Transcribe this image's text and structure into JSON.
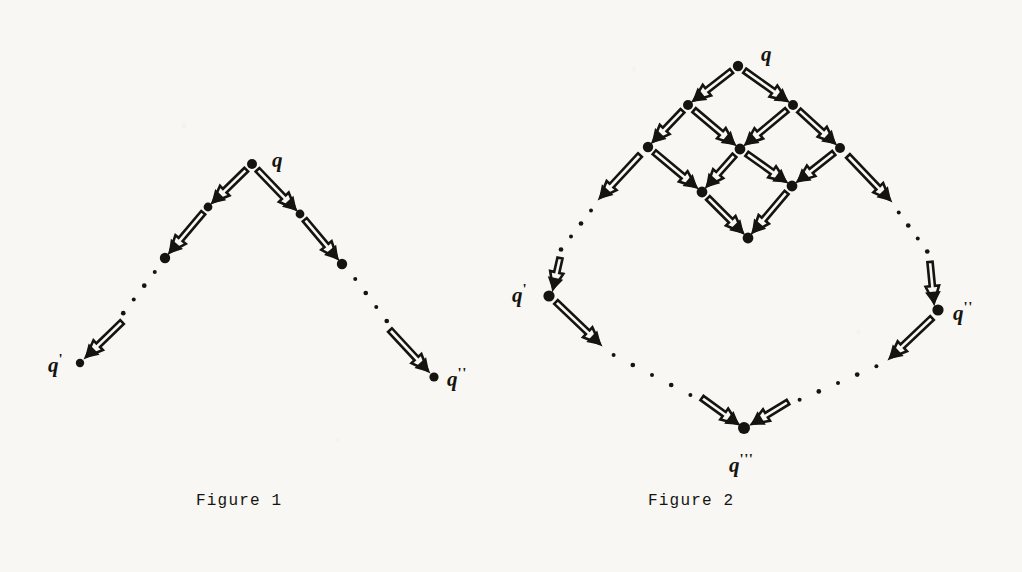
{
  "document": {
    "background_color": "#f8f7f3",
    "ink_color": "#16140f",
    "kind": "scanned-mathematical-figure-page"
  },
  "figures": [
    {
      "id": "figure-1",
      "caption": "Figure 1",
      "caption_pos": [
        196,
        492
      ],
      "description": "Inverted-V chain diagram: source node q at apex with two descending double-arrow chains, each broken by a dotted continuation, ending at q' (left) and q'' (right).",
      "nodes": [
        {
          "id": "f1-q",
          "label": "q",
          "prime": "",
          "x": 252,
          "y": 164,
          "r": 5.0,
          "label_x": 272,
          "label_y": 150
        },
        {
          "id": "f1-l1",
          "label": "",
          "prime": "",
          "x": 208,
          "y": 207,
          "r": 4.4
        },
        {
          "id": "f1-l2",
          "label": "",
          "prime": "",
          "x": 165,
          "y": 258,
          "r": 5.2
        },
        {
          "id": "f1-qp",
          "label": "q",
          "prime": "'",
          "x": 80,
          "y": 363,
          "r": 4.2,
          "label_x": 48,
          "label_y": 352
        },
        {
          "id": "f1-r1",
          "label": "",
          "prime": "",
          "x": 300,
          "y": 214,
          "r": 4.4
        },
        {
          "id": "f1-r2",
          "label": "",
          "prime": "",
          "x": 342,
          "y": 264,
          "r": 5.2
        },
        {
          "id": "f1-qpp",
          "label": "q",
          "prime": "''",
          "x": 434,
          "y": 377,
          "r": 4.6,
          "label_x": 447,
          "label_y": 366
        }
      ],
      "arrows": [
        {
          "from": "f1-q",
          "to": "f1-l1"
        },
        {
          "from": "f1-l1",
          "to": "f1-l2"
        },
        {
          "from": "f1-q",
          "to": "f1-r1"
        },
        {
          "from": "f1-r1",
          "to": "f1-r2"
        }
      ],
      "dotted_paths": [
        {
          "from": [
            160,
            265
          ],
          "to": [
            118,
            320
          ],
          "dots": 4
        },
        {
          "from": [
            350,
            272
          ],
          "to": [
            392,
            328
          ],
          "dots": 4
        }
      ],
      "terminal_arrows": [
        {
          "from": [
            122,
            322
          ],
          "to": [
            86,
            357
          ]
        },
        {
          "from": [
            390,
            330
          ],
          "to": [
            428,
            371
          ]
        }
      ]
    },
    {
      "id": "figure-2",
      "caption": "Figure 2",
      "caption_pos": [
        648,
        492
      ],
      "description": "Diamond lattice diagram: top node q fans out through a 3x3 grid of intermediate nodes, then dotted continuations reach q' (left) and q'' (right), which converge via dotted paths onto q''' at the bottom.",
      "nodes": [
        {
          "id": "f2-q",
          "label": "q",
          "prime": "",
          "x": 738,
          "y": 66,
          "r": 5.2,
          "label_x": 761,
          "label_y": 44
        },
        {
          "id": "f2-a1",
          "label": "",
          "prime": "",
          "x": 688,
          "y": 105,
          "r": 5.0
        },
        {
          "id": "f2-a2",
          "label": "",
          "prime": "",
          "x": 793,
          "y": 105,
          "r": 5.0
        },
        {
          "id": "f2-b1",
          "label": "",
          "prime": "",
          "x": 648,
          "y": 147,
          "r": 5.2
        },
        {
          "id": "f2-b2",
          "label": "",
          "prime": "",
          "x": 740,
          "y": 149,
          "r": 5.4
        },
        {
          "id": "f2-b3",
          "label": "",
          "prime": "",
          "x": 840,
          "y": 148,
          "r": 5.0
        },
        {
          "id": "f2-c1",
          "label": "",
          "prime": "",
          "x": 702,
          "y": 192,
          "r": 5.4
        },
        {
          "id": "f2-c2",
          "label": "",
          "prime": "",
          "x": 792,
          "y": 186,
          "r": 5.4
        },
        {
          "id": "f2-d1",
          "label": "",
          "prime": "",
          "x": 748,
          "y": 238,
          "r": 5.4
        },
        {
          "id": "f2-qp",
          "label": "q",
          "prime": "'",
          "x": 549,
          "y": 296,
          "r": 5.6,
          "label_x": 512,
          "label_y": 282
        },
        {
          "id": "f2-qpp",
          "label": "q",
          "prime": "''",
          "x": 938,
          "y": 310,
          "r": 5.6,
          "label_x": 953,
          "label_y": 300
        },
        {
          "id": "f2-qppp",
          "label": "q",
          "prime": "'''",
          "x": 744,
          "y": 428,
          "r": 6.0,
          "label_x": 729,
          "label_y": 452
        }
      ],
      "arrows": [
        {
          "from": "f2-q",
          "to": "f2-a1"
        },
        {
          "from": "f2-q",
          "to": "f2-a2"
        },
        {
          "from": "f2-a1",
          "to": "f2-b1"
        },
        {
          "from": "f2-a1",
          "to": "f2-b2"
        },
        {
          "from": "f2-a2",
          "to": "f2-b2"
        },
        {
          "from": "f2-a2",
          "to": "f2-b3"
        },
        {
          "from": "f2-b1",
          "to": "f2-c1"
        },
        {
          "from": "f2-b2",
          "to": "f2-c1"
        },
        {
          "from": "f2-b2",
          "to": "f2-c2"
        },
        {
          "from": "f2-b3",
          "to": "f2-c2"
        },
        {
          "from": "f2-c1",
          "to": "f2-d1"
        },
        {
          "from": "f2-c2",
          "to": "f2-d1"
        },
        {
          "from": "f2-qp",
          "to": null,
          "free": {
            "from": [
              556,
              302
            ],
            "to": [
              600,
              344
            ]
          }
        },
        {
          "from": "f2-b1",
          "to": null,
          "free": {
            "from": [
              640,
              155
            ],
            "to": [
              600,
              198
            ]
          }
        },
        {
          "from": "f2-b3",
          "to": null,
          "free": {
            "from": [
              848,
              156
            ],
            "to": [
              890,
              200
            ]
          }
        },
        {
          "from": "f2-qpp",
          "to": null,
          "free": {
            "from": [
              932,
              318
            ],
            "to": [
              890,
              358
            ]
          }
        }
      ],
      "dotted_paths": [
        {
          "from": [
            596,
            204
          ],
          "to": [
            556,
            256
          ],
          "dots": 4
        },
        {
          "from": [
            894,
            206
          ],
          "to": [
            932,
            258
          ],
          "dots": 4
        },
        {
          "from": [
            604,
            350
          ],
          "to": [
            700,
            400
          ],
          "dots": 5
        },
        {
          "from": [
            886,
            362
          ],
          "to": [
            790,
            404
          ],
          "dots": 5
        }
      ],
      "terminal_arrows": [
        {
          "from": [
            560,
            258
          ],
          "to": [
            553,
            289
          ]
        },
        {
          "from": [
            930,
            262
          ],
          "to": [
            934,
            303
          ]
        },
        {
          "from": [
            702,
            398
          ],
          "to": [
            738,
            424
          ]
        },
        {
          "from": [
            788,
            402
          ],
          "to": [
            752,
            424
          ]
        }
      ]
    }
  ]
}
